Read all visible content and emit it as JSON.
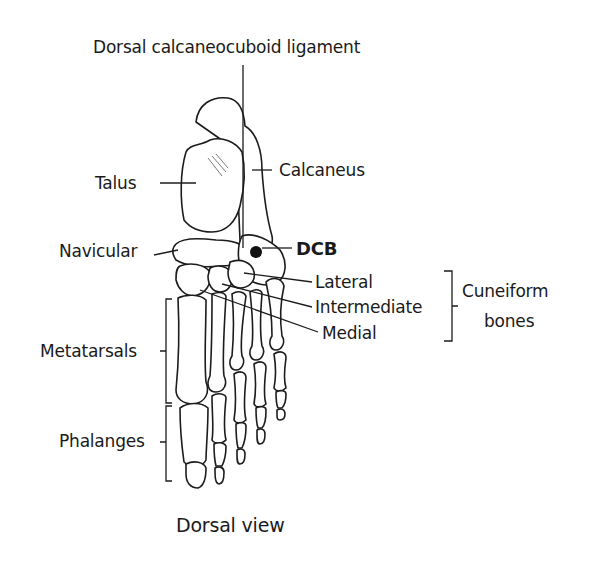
{
  "title": "Dorsal calcaneocuboid ligament",
  "caption": "Dorsal view",
  "labels": {
    "talus": "Talus",
    "calcaneus": "Calcaneus",
    "navicular": "Navicular",
    "dcb": "DCB",
    "lateral": "Lateral",
    "intermediate": "Intermediate",
    "medial": "Medial",
    "cuneiform_line1": "Cuneiform",
    "cuneiform_line2": "bones",
    "metatarsals": "Metatarsals",
    "phalanges": "Phalanges"
  }
}
